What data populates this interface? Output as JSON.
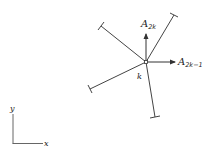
{
  "diagram": {
    "type": "node-with-members",
    "node": {
      "label": "k",
      "x": 146,
      "y": 62
    },
    "members": [
      {
        "name": "member-upper-left",
        "x2": 101,
        "y2": 26
      },
      {
        "name": "member-upper-right",
        "x2": 174,
        "y2": 15
      },
      {
        "name": "member-lower-left",
        "x2": 90,
        "y2": 89
      },
      {
        "name": "member-bottom",
        "x2": 155,
        "y2": 117
      }
    ],
    "forces": [
      {
        "name": "A2k",
        "base": "A",
        "subscript": "2k",
        "direction": "up"
      },
      {
        "name": "A2k-1",
        "base": "A",
        "subscript": "2k−1",
        "direction": "right"
      }
    ],
    "axes": {
      "x_label": "x",
      "y_label": "y"
    },
    "colors": {
      "stroke": "#333333",
      "background": "#ffffff"
    }
  }
}
